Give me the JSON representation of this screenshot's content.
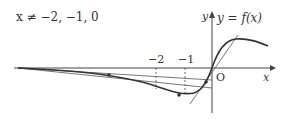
{
  "condition": "x ≠ −2, −1, 0",
  "function_label": "y = f(x)",
  "axes": {
    "x_label": "x",
    "y_label": "y",
    "origin_label": "O"
  },
  "ticks": [
    {
      "label": "−2"
    },
    {
      "label": "−1"
    }
  ],
  "colors": {
    "curve": "#333333",
    "tangent": "#555555",
    "axis": "#444444"
  }
}
